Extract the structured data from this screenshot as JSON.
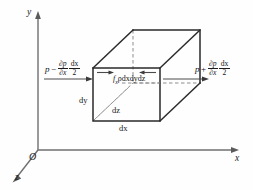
{
  "figure": {
    "kind": "fluid-element-force-balance-diagram",
    "axes": {
      "y_label": "y",
      "x_label": "x",
      "z_label": "z",
      "origin_label": "O"
    },
    "dimensions": {
      "dy": "dy",
      "dz": "dz",
      "dx": "dx"
    },
    "left_force": {
      "base": "p",
      "operator": "−",
      "deriv_numerator": "∂p",
      "deriv_denominator": "∂x",
      "step_numerator": "dx",
      "step_denominator": "2",
      "full_text": "p − ∂p/∂x · dx/2"
    },
    "right_force": {
      "base": "p",
      "operator": "+",
      "deriv_numerator": "∂p",
      "deriv_denominator": "∂x",
      "step_numerator": "dx",
      "step_denominator": "2",
      "full_text": "p + ∂p/∂x · dx/2"
    },
    "body_force": {
      "symbol": "f",
      "subscript": "x",
      "density": "ρ",
      "volume": "dxdydz",
      "full_text": "fₓ ρdxdydz"
    },
    "colors": {
      "background": "#fefefe",
      "axis": "#6f6f6f",
      "edge": "#2a2a2a",
      "hidden_edge": "#8d8d8d",
      "arrow": "#3a3a3a",
      "text": "#1c1c1c"
    }
  }
}
